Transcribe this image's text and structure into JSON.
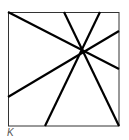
{
  "figure": {
    "label": "K",
    "square": {
      "x1": 8,
      "y1": 12,
      "x2": 119,
      "y2": 126
    },
    "center": {
      "x": 82,
      "y": 51
    },
    "lines": [
      {
        "x1": 8,
        "y1": 12,
        "x2": 119,
        "y2": 69
      },
      {
        "x1": 64,
        "y1": 12,
        "x2": 119,
        "y2": 126
      },
      {
        "x1": 100,
        "y1": 12,
        "x2": 45,
        "y2": 126
      },
      {
        "x1": 119,
        "y1": 31,
        "x2": 8,
        "y2": 97
      }
    ],
    "stroke_color": "#000000",
    "border_color": "#333333"
  }
}
